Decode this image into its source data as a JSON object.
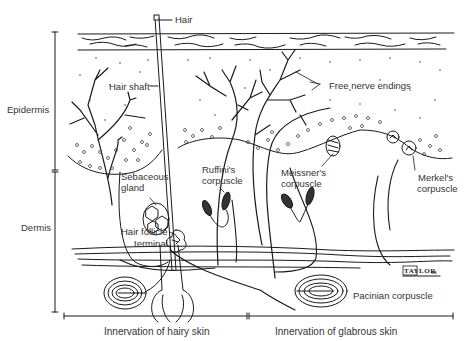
{
  "diagram": {
    "layers": {
      "epidermis": "Epidermis",
      "dermis": "Dermis"
    },
    "labels": {
      "hair": "Hair",
      "hair_shaft": "Hair shaft",
      "free_nerve_endings": "Free nerve endings",
      "sebaceous_gland_1": "Sebaceous",
      "sebaceous_gland_2": "gland",
      "ruffini_1": "Ruffini's",
      "ruffini_2": "corpuscle",
      "meissner_1": "Meissner's",
      "meissner_2": "corpuscle",
      "merkel_1": "Merkel's",
      "merkel_2": "corpuscle",
      "hair_follicle_1": "Hair follicle",
      "hair_follicle_2": "terminal",
      "pacinian": "Pacinian corpuscle"
    },
    "regions": {
      "hairy": "Innervation of hairy skin",
      "glabrous": "Innervation of glabrous skin"
    },
    "signature": {
      "name": "TAYLOR",
      "year": "08"
    },
    "colors": {
      "ink": "#1a1a1a",
      "label": "#333333",
      "background": "#ffffff"
    }
  }
}
